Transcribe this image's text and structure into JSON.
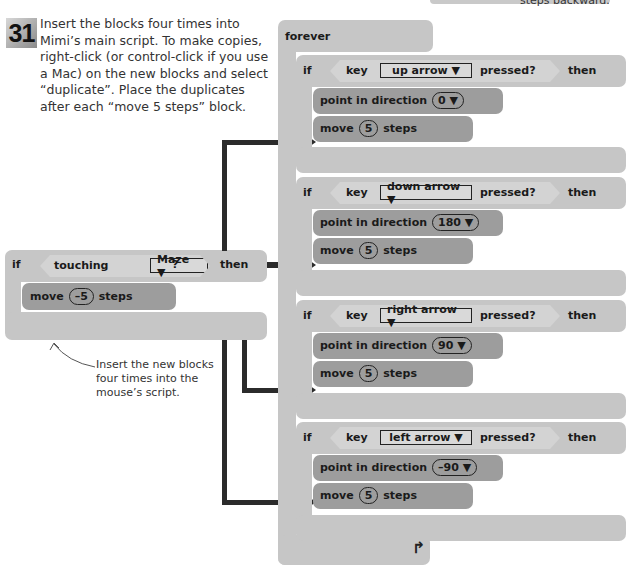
{
  "step": {
    "number": "31",
    "instruction": "Insert the blocks four times into Mimi’s main script. To make copies, right-click (or control-click if you use a Mac) on the new blocks and select “duplicate”. Place the duplicates after each “move 5 steps” block."
  },
  "top_right_fragment": "steps backward.",
  "annotation": "Insert the new blocks four times into the mouse’s script.",
  "new_block": {
    "if_label": "if",
    "condition": "touching",
    "dropdown": "Maze ▼",
    "question": "?",
    "then_label": "then",
    "inner": {
      "move": "move",
      "value": "–5",
      "steps": "steps"
    }
  },
  "main_script": {
    "forever_label": "forever",
    "loop_arrow": "↰",
    "branches": [
      {
        "if": "if",
        "key": "key",
        "dropdown": "up arrow ▼",
        "pressed": "pressed?",
        "then": "then",
        "point": "point in direction",
        "direction": "0 ▼",
        "move": "move",
        "steps_value": "5",
        "steps": "steps"
      },
      {
        "if": "if",
        "key": "key",
        "dropdown": "down arrow ▼",
        "pressed": "pressed?",
        "then": "then",
        "point": "point in direction",
        "direction": "180 ▼",
        "move": "move",
        "steps_value": "5",
        "steps": "steps"
      },
      {
        "if": "if",
        "key": "key",
        "dropdown": "right arrow ▼",
        "pressed": "pressed?",
        "then": "then",
        "point": "point in direction",
        "direction": "90 ▼",
        "move": "move",
        "steps_value": "5",
        "steps": "steps"
      },
      {
        "if": "if",
        "key": "key",
        "dropdown": "left arrow ▼",
        "pressed": "pressed?",
        "then": "then",
        "point": "point in direction",
        "direction": "–90 ▼",
        "move": "move",
        "steps_value": "5",
        "steps": "steps"
      }
    ]
  },
  "colors": {
    "light_block": "#c6c6c6",
    "dark_block": "#9d9d9d",
    "arrow": "#2b2b2b"
  }
}
